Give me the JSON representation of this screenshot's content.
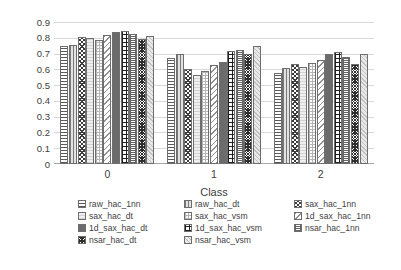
{
  "chart_data": {
    "type": "bar",
    "title": "",
    "xlabel": "Class",
    "ylabel": "Recall",
    "categories": [
      "0",
      "1",
      "2"
    ],
    "ylim": [
      0,
      0.9
    ],
    "yticks": [
      "0",
      "0.1",
      "0.2",
      "0.3",
      "0.4",
      "0.5",
      "0.6",
      "0.7",
      "0.8",
      "0.9"
    ],
    "grid": true,
    "legend_position": "bottom",
    "series": [
      {
        "name": "raw_hac_1nn",
        "values": [
          0.75,
          0.67,
          0.58
        ]
      },
      {
        "name": "raw_hac_dt",
        "values": [
          0.755,
          0.7,
          0.61
        ]
      },
      {
        "name": "sax_hac_1nn",
        "values": [
          0.805,
          0.6,
          0.637
        ]
      },
      {
        "name": "sax_hac_dt",
        "values": [
          0.8,
          0.565,
          0.615
        ]
      },
      {
        "name": "sax_hac_vsm",
        "values": [
          0.785,
          0.59,
          0.638
        ]
      },
      {
        "name": "1d_sax_hac_1nn",
        "values": [
          0.815,
          0.625,
          0.66
        ]
      },
      {
        "name": "1d_sax_hac_dt",
        "values": [
          0.835,
          0.648,
          0.7
        ]
      },
      {
        "name": "1d_sax_hac_vsm",
        "values": [
          0.84,
          0.715,
          0.712
        ]
      },
      {
        "name": "nsar_hac_1nn",
        "values": [
          0.825,
          0.725,
          0.677
        ]
      },
      {
        "name": "nsar_hac_dt",
        "values": [
          0.795,
          0.7,
          0.635
        ]
      },
      {
        "name": "nsar_hac_vsm",
        "values": [
          0.81,
          0.745,
          0.7
        ]
      }
    ]
  },
  "legend": {
    "entries": [
      "raw_hac_1nn",
      "raw_hac_dt",
      "sax_hac_1nn",
      "sax_hac_dt",
      "sax_hac_vsm",
      "1d_sax_hac_1nn",
      "1d_sax_hac_dt",
      "1d_sax_hac_vsm",
      "nsar_hac_1nn",
      "nsar_hac_dt",
      "nsar_hac_vsm"
    ]
  }
}
